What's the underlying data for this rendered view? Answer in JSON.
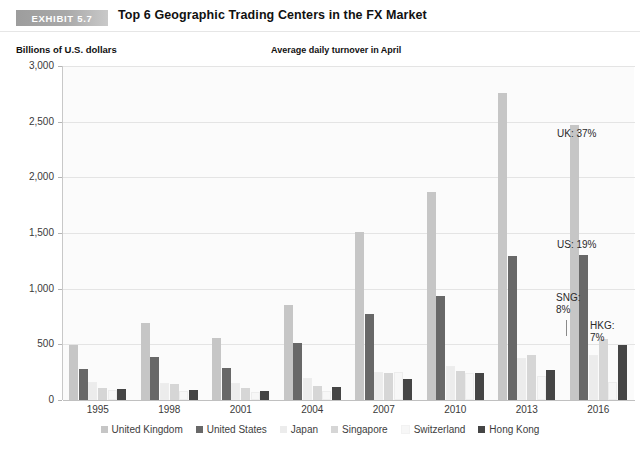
{
  "header": {
    "badge": "EXHIBIT 5.7",
    "title": "Top 6 Geographic Trading Centers in the FX Market"
  },
  "axis_unit_label": "Billions of U.S. dollars",
  "subtitle": "Average daily turnover in April",
  "annotations": [
    {
      "text": "UK: 37%"
    },
    {
      "text": "US: 19%"
    },
    {
      "text": "SNG:\n8%"
    },
    {
      "text": "HKG:\n7%"
    }
  ],
  "chart_data": {
    "type": "bar",
    "title": "Top 6 Geographic Trading Centers in the FX Market",
    "subtitle": "Average daily turnover in April",
    "xlabel": "",
    "ylabel": "Billions of U.S. dollars",
    "ylim": [
      0,
      3000
    ],
    "yticks": [
      0,
      500,
      1000,
      1500,
      2000,
      2500,
      3000
    ],
    "ytick_labels": [
      "0",
      "500",
      "1,000",
      "1,500",
      "2,000",
      "2,500",
      "3,000"
    ],
    "grid": true,
    "legend_position": "bottom",
    "categories": [
      "1995",
      "1998",
      "2001",
      "2004",
      "2007",
      "2010",
      "2013",
      "2016"
    ],
    "series": [
      {
        "name": "United Kingdom",
        "color": "#c6c6c6",
        "values": [
          490,
          690,
          560,
          850,
          1510,
          1870,
          2760,
          2470
        ]
      },
      {
        "name": "United States",
        "color": "#686868",
        "values": [
          280,
          385,
          285,
          510,
          770,
          930,
          1290,
          1300
        ]
      },
      {
        "name": "Japan",
        "color": "#ececec",
        "values": [
          160,
          150,
          150,
          200,
          250,
          310,
          380,
          400
        ]
      },
      {
        "name": "Singapore",
        "color": "#d6d6d6",
        "values": [
          105,
          140,
          105,
          130,
          240,
          260,
          400,
          550
        ]
      },
      {
        "name": "Switzerland",
        "color": "#f7f7f7",
        "values": [
          90,
          85,
          75,
          80,
          250,
          245,
          215,
          160
        ]
      },
      {
        "name": "Hong Kong",
        "color": "#454545",
        "values": [
          95,
          90,
          80,
          120,
          190,
          240,
          270,
          490
        ]
      }
    ]
  }
}
